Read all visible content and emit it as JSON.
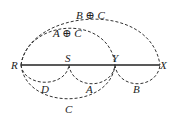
{
  "diagram": {
    "points": [
      {
        "id": "R",
        "label": "R"
      },
      {
        "id": "S",
        "label": "S"
      },
      {
        "id": "Y",
        "label": "Y"
      },
      {
        "id": "X",
        "label": "X"
      }
    ],
    "upper_arcs": [
      {
        "label": "B ⊕ C",
        "from": "R",
        "to": "X"
      },
      {
        "label": "A ⊕ C",
        "from": "R",
        "to": "Y"
      }
    ],
    "lower_arcs": [
      {
        "label": "D",
        "from": "R",
        "to": "S"
      },
      {
        "label": "A",
        "from": "S",
        "to": "Y"
      },
      {
        "label": "B",
        "from": "Y",
        "to": "X"
      },
      {
        "label": "C",
        "from": "R",
        "to": "Y"
      }
    ]
  }
}
